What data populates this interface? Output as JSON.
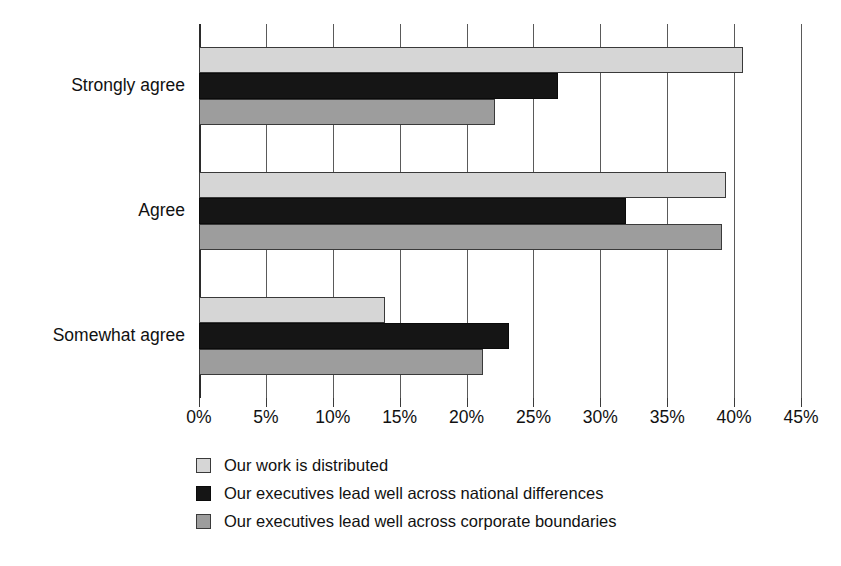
{
  "chart_data": {
    "type": "bar",
    "orientation": "horizontal",
    "title": "",
    "subtitle": "",
    "xlabel": "",
    "ylabel": "",
    "xlim": [
      0,
      45
    ],
    "xtick_step": 5,
    "xtick_labels": [
      "0%",
      "5%",
      "10%",
      "15%",
      "20%",
      "25%",
      "30%",
      "35%",
      "40%",
      "45%"
    ],
    "xtick_values": [
      0,
      5,
      10,
      15,
      20,
      25,
      30,
      35,
      40,
      45
    ],
    "value_suffix": "%",
    "grid": "vertical",
    "legend_position": "bottom-left",
    "categories": [
      "Strongly agree",
      "Agree",
      "Somewhat agree"
    ],
    "series": [
      {
        "name": "Our work is distributed",
        "color": "#d6d6d6",
        "values": [
          40.7,
          39.4,
          13.9
        ]
      },
      {
        "name": "Our executives lead well across national differences",
        "color": "#151515",
        "values": [
          26.8,
          31.9,
          23.2
        ]
      },
      {
        "name": "Our executives lead well across corporate boundaries",
        "color": "#9d9d9d",
        "values": [
          22.1,
          39.1,
          21.2
        ]
      }
    ]
  },
  "style": {
    "background": "#ffffff",
    "gridline_color": "#5a5a5a",
    "axis_color": "#2b2b2b",
    "bar_border": "#3a3a3a",
    "text_color": "#111111"
  }
}
